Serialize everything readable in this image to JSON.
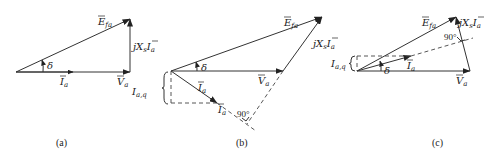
{
  "figure": {
    "panels": [
      {
        "id": "a",
        "caption": "(a)",
        "labels": {
          "E": "E",
          "E_sub": "fa",
          "jX": "jX",
          "jX_sub": "s",
          "jX_I": "I",
          "jX_I_sub": "a",
          "I": "I",
          "I_sub": "a",
          "V": "V",
          "V_sub": "a",
          "angle": "δ"
        }
      },
      {
        "id": "b",
        "caption": "(b)",
        "labels": {
          "E": "E",
          "E_sub": "fa",
          "jX": "jX",
          "jX_sub": "s",
          "jX_I": "I",
          "jX_I_sub": "a",
          "I": "I",
          "I_sub": "a",
          "I2": "I",
          "I2_sub": "a",
          "V": "V",
          "V_sub": "a",
          "Iaq": "I",
          "Iaq_sub": "a,q",
          "angle": "δ",
          "right_angle": "90°"
        }
      },
      {
        "id": "c",
        "caption": "(c)",
        "labels": {
          "E": "E",
          "E_sub": "fa",
          "jX": "jX",
          "jX_sub": "s",
          "jX_I": "I",
          "jX_I_sub": "a",
          "I": "I",
          "I_sub": "a",
          "V": "V",
          "V_sub": "a",
          "Iaq": "I",
          "Iaq_sub": "a,q",
          "angle": "δ",
          "right_angle": "90°"
        }
      }
    ]
  }
}
